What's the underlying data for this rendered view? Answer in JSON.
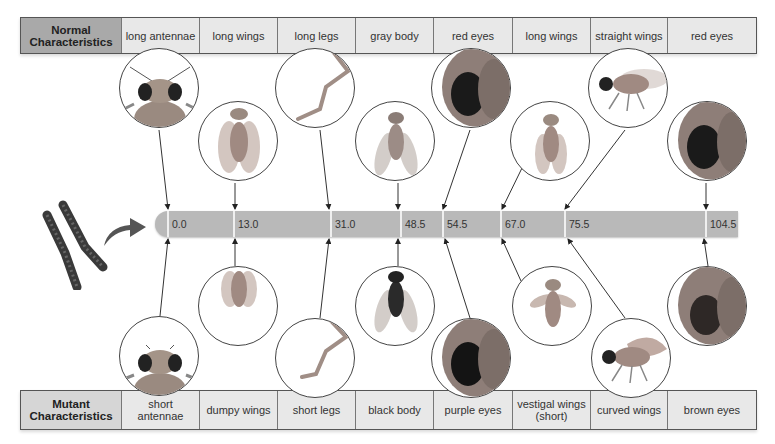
{
  "normal": {
    "header": "Normal Characteristics",
    "traits": [
      {
        "label": "long antennae",
        "icon": "fly-head-antennae-icon"
      },
      {
        "label": "long wings",
        "icon": "fly-long-wings-icon"
      },
      {
        "label": "long legs",
        "icon": "fly-leg-long-icon"
      },
      {
        "label": "gray body",
        "icon": "fly-gray-body-icon"
      },
      {
        "label": "red eyes",
        "icon": "fly-eye-red-icon"
      },
      {
        "label": "long wings",
        "icon": "fly-long-wings-icon"
      },
      {
        "label": "straight wings",
        "icon": "fly-straight-wings-icon"
      },
      {
        "label": "red eyes",
        "icon": "fly-eye-red-icon"
      }
    ]
  },
  "mutant": {
    "header": "Mutant Characteristics",
    "traits": [
      {
        "label": "short antennae",
        "icon": "fly-head-short-antennae-icon"
      },
      {
        "label": "dumpy wings",
        "icon": "fly-dumpy-wings-icon"
      },
      {
        "label": "short legs",
        "icon": "fly-leg-short-icon"
      },
      {
        "label": "black body",
        "icon": "fly-black-body-icon"
      },
      {
        "label": "purple eyes",
        "icon": "fly-eye-purple-icon"
      },
      {
        "label": "vestigal wings (short)",
        "icon": "fly-vestigial-wings-icon"
      },
      {
        "label": "curved wings",
        "icon": "fly-curved-wings-icon"
      },
      {
        "label": "brown eyes",
        "icon": "fly-eye-brown-icon"
      }
    ]
  },
  "chromosome_map": {
    "loci": [
      "0.0",
      "13.0",
      "31.0",
      "48.5",
      "54.5",
      "67.0",
      "75.5",
      "104.5"
    ]
  },
  "colors": {
    "normal_header": "#a9a9a9",
    "mutant_header": "#d6d6d6",
    "cell_bg": "#e8e8e8",
    "chromosome_bar": "#b9b9b9",
    "chromosome": "#3a3a3a"
  }
}
